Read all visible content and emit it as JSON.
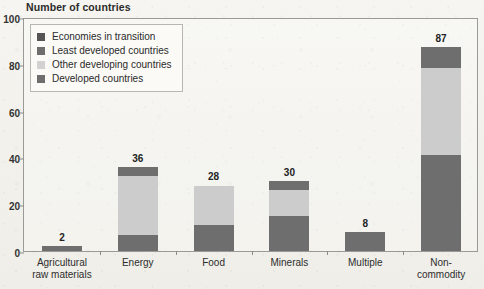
{
  "chart_data": {
    "type": "bar",
    "title": "Number of countries",
    "subtitle": "",
    "xlabel": "",
    "ylabel": "",
    "ylim": [
      0,
      100
    ],
    "yticks": [
      0,
      20,
      40,
      60,
      80,
      100
    ],
    "grid": false,
    "stacked": true,
    "legend_position": "top-left",
    "categories": [
      "Agricultural\nraw materials",
      "Energy",
      "Food",
      "Minerals",
      "Multiple",
      "Non-commodity"
    ],
    "totals": [
      2,
      36,
      28,
      30,
      8,
      87
    ],
    "series": [
      {
        "name": "Developed countries",
        "color": "#6e6e6e",
        "values": [
          2,
          7,
          11,
          15,
          8,
          41
        ]
      },
      {
        "name": "Other developing countries",
        "color": "#cccccc",
        "values": [
          0,
          25,
          17,
          11,
          0,
          37
        ]
      },
      {
        "name": "Least developed countries",
        "color": "#6e6e6e",
        "values": [
          0,
          4,
          0,
          4,
          0,
          9
        ]
      },
      {
        "name": "Economies in transition",
        "color": "#555555",
        "values": [
          0,
          0,
          0,
          0,
          0,
          0
        ]
      }
    ]
  },
  "legend": {
    "items": [
      {
        "label": "Economies in transition",
        "color": "#555555"
      },
      {
        "label": "Least developed countries",
        "color": "#6e6e6e"
      },
      {
        "label": "Other developing countries",
        "color": "#d2d2d2"
      },
      {
        "label": "Developed countries",
        "color": "#6e6e6e"
      }
    ]
  },
  "axis": {
    "y_tick_labels": [
      "0",
      "20",
      "40",
      "60",
      "80",
      "100"
    ]
  }
}
